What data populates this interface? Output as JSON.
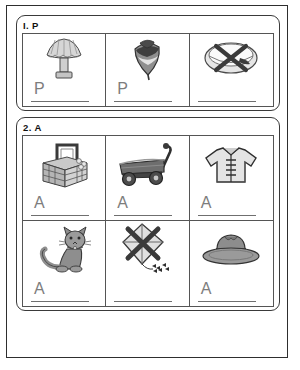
{
  "worksheet": {
    "sections": [
      {
        "id": "section-1",
        "heading": "I. P",
        "rows": [
          [
            {
              "icon": "lamp-icon",
              "label": "lamp",
              "answer": "P",
              "crossed_out": false
            },
            {
              "icon": "spinning-top-icon",
              "label": "top",
              "answer": "P",
              "crossed_out": false
            },
            {
              "icon": "basket-icon",
              "label": "basket",
              "answer": "",
              "crossed_out": true
            }
          ]
        ]
      },
      {
        "id": "section-2",
        "heading": "2. A",
        "rows": [
          [
            {
              "icon": "picnic-basket-icon",
              "label": "basket",
              "answer": "A",
              "crossed_out": false
            },
            {
              "icon": "wagon-icon",
              "label": "wagon",
              "answer": "A",
              "crossed_out": false
            },
            {
              "icon": "shirt-icon",
              "label": "shirt",
              "answer": "A",
              "crossed_out": false
            }
          ],
          [
            {
              "icon": "cat-icon",
              "label": "cat",
              "answer": "A",
              "crossed_out": false
            },
            {
              "icon": "kite-icon",
              "label": "kite",
              "answer": "",
              "crossed_out": true
            },
            {
              "icon": "hat-icon",
              "label": "hat",
              "answer": "A",
              "crossed_out": false
            }
          ]
        ]
      }
    ]
  },
  "colors": {
    "page_border": "#2e2e2e",
    "section_border": "#3a3a3a",
    "grid_line": "#555555",
    "handwriting": "#7d7d7d",
    "cross_out": "#3a3a3a",
    "art_fill_light": "#d9d9d9",
    "art_fill_mid": "#9e9e9e",
    "art_fill_dark": "#4a4a4a",
    "background": "#ffffff"
  }
}
